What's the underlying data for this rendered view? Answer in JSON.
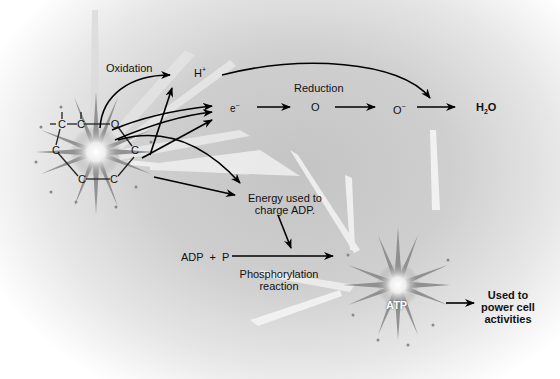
{
  "diagram": {
    "labels": {
      "oxidation": "Oxidation",
      "h_plus": "H",
      "h_plus_sup": "+",
      "reduction": "Reduction",
      "electron": "e",
      "electron_sup": "−",
      "oxygen": "O",
      "oxygen_ion": "O",
      "oxygen_ion_sup": "−",
      "water_h": "H",
      "water_sub": "2",
      "water_o": "O",
      "energy_line1": "Energy used to",
      "energy_line2": "charge ADP.",
      "adp_p": "ADP  +  P",
      "phos_line1": "Phosphorylation",
      "phos_line2": "reaction",
      "atp": "ATP",
      "used_line1": "Used to",
      "used_line2": "power cell",
      "used_line3": "activities"
    },
    "molecule": {
      "atoms": [
        "C",
        "C",
        "O",
        "C",
        "C",
        "C",
        "C"
      ],
      "description": "glucose ring (carbon skeleton)"
    },
    "flow": [
      {
        "from": "glucose",
        "to": "H+",
        "label": "Oxidation"
      },
      {
        "from": "glucose",
        "to": "e-"
      },
      {
        "from": "e-",
        "to": "O",
        "label": "Reduction"
      },
      {
        "from": "O",
        "to": "O-"
      },
      {
        "from": "O-",
        "to": "H2O"
      },
      {
        "from": "H+",
        "to": "H2O"
      },
      {
        "from": "glucose",
        "to": "Energy used to charge ADP."
      },
      {
        "from": "Energy used to charge ADP.",
        "to": "Phosphorylation reaction"
      },
      {
        "from": "ADP + P",
        "to": "ATP",
        "label": "Phosphorylation reaction"
      },
      {
        "from": "ATP",
        "to": "Used to power cell activities"
      }
    ],
    "colors": {
      "background_center": "#c4c4c4",
      "background_edge": "#ffffff",
      "arrow": "#000000",
      "burst": "#8a8a8a"
    }
  }
}
